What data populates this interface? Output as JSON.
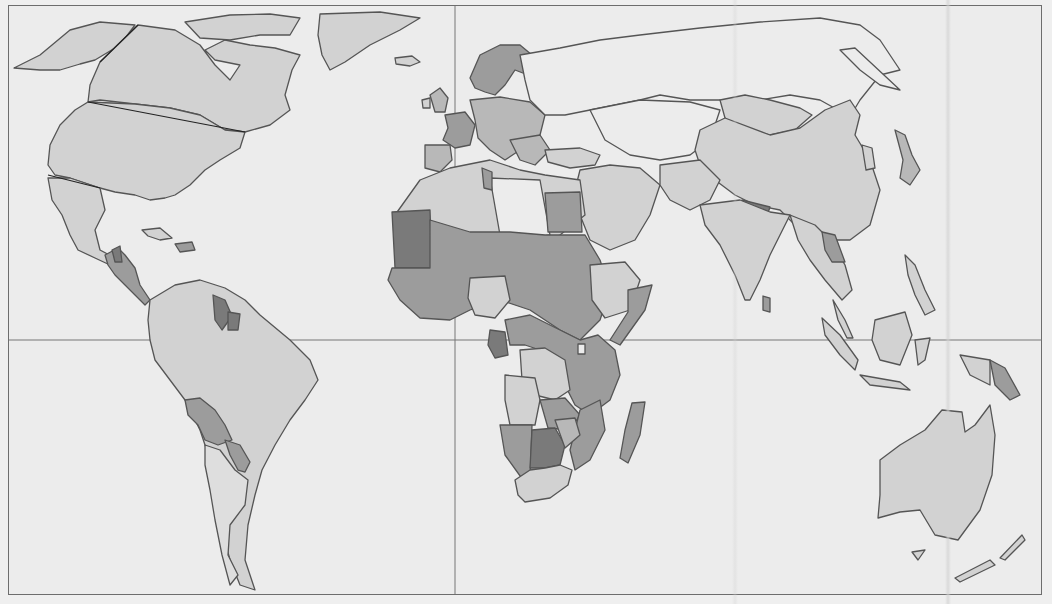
{
  "map": {
    "type": "choropleth-world-map",
    "projection": "equirectangular-like",
    "shading_levels": {
      "none": "#ececec",
      "level1": "#d2d2d2",
      "level2": "#b8b8b8",
      "level3": "#9c9c9c",
      "level4": "#7a7a7a"
    },
    "reference_lines": {
      "equator_y": 340,
      "prime_meridian_x": 455
    },
    "labels": []
  }
}
